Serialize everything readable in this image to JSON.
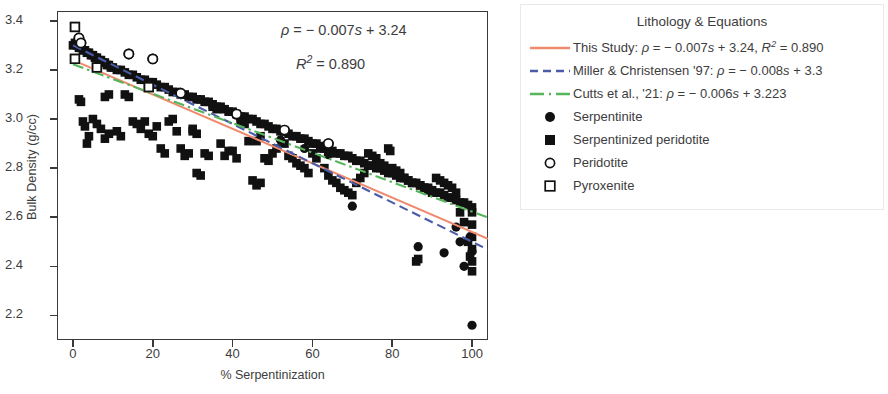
{
  "chart_data": {
    "type": "scatter",
    "title": "",
    "xlabel": "% Serpentinization",
    "ylabel": "Bulk Density (g/cc)",
    "xlim": [
      -4,
      104
    ],
    "ylim": [
      2.1,
      3.44
    ],
    "xticks": [
      "0",
      "20",
      "40",
      "60",
      "80",
      "100"
    ],
    "xtick_values": [
      0,
      20,
      40,
      60,
      80,
      100
    ],
    "yticks": [
      "3.4",
      "3.2",
      "3.0",
      "2.8",
      "2.6",
      "2.4",
      "2.2"
    ],
    "ytick_values": [
      3.4,
      3.2,
      3.0,
      2.8,
      2.6,
      2.4,
      2.2
    ],
    "grid": false,
    "legend_position": "right-outside",
    "annotations": [
      {
        "id": "equation",
        "text": "ρ = − 0.007s + 3.24",
        "x": 68,
        "y": 3.33
      },
      {
        "id": "r_squared",
        "text": "R² = 0.890",
        "x": 70,
        "y": 3.24
      }
    ],
    "fits": [
      {
        "name": "This Study",
        "slope": -0.007,
        "intercept": 3.24,
        "r2": 0.89,
        "color": "#ef8a6e",
        "style": "solid"
      },
      {
        "name": "Miller & Christensen '97",
        "slope": -0.008,
        "intercept": 3.3,
        "color": "#4a5ba8",
        "style": "dashed"
      },
      {
        "name": "Cutts et al., '21",
        "slope": -0.006,
        "intercept": 3.223,
        "color": "#56b45b",
        "style": "dashdot"
      }
    ],
    "series": [
      {
        "name": "Serpentinite",
        "marker": "filled-circle",
        "color": "#111111",
        "points": [
          [
            100,
            2.16
          ],
          [
            70,
            2.645
          ],
          [
            86.5,
            2.48
          ],
          [
            93,
            2.455
          ],
          [
            98,
            2.4
          ],
          [
            99.5,
            2.52
          ],
          [
            96,
            2.56
          ],
          [
            52,
            2.915
          ],
          [
            64,
            2.855
          ],
          [
            58,
            2.88
          ],
          [
            100,
            2.46
          ],
          [
            97,
            2.5
          ]
        ]
      },
      {
        "name": "Serpentinized peridotite",
        "marker": "filled-square",
        "color": "#111111",
        "points": [
          [
            0,
            3.3
          ],
          [
            0.5,
            3.31
          ],
          [
            1,
            3.3
          ],
          [
            1.5,
            3.29
          ],
          [
            2,
            3.29
          ],
          [
            2.5,
            3.28
          ],
          [
            3,
            3.28
          ],
          [
            3.5,
            3.27
          ],
          [
            4,
            3.27
          ],
          [
            4.5,
            3.26
          ],
          [
            5,
            3.26
          ],
          [
            5.5,
            3.25
          ],
          [
            6,
            3.25
          ],
          [
            6.5,
            3.24
          ],
          [
            7,
            3.24
          ],
          [
            7.5,
            3.23
          ],
          [
            8,
            3.23
          ],
          [
            8.5,
            3.22
          ],
          [
            9,
            3.22
          ],
          [
            9.5,
            3.21
          ],
          [
            10,
            3.21
          ],
          [
            11,
            3.2
          ],
          [
            12,
            3.2
          ],
          [
            13,
            3.19
          ],
          [
            14,
            3.18
          ],
          [
            15,
            3.18
          ],
          [
            16,
            3.17
          ],
          [
            17,
            3.16
          ],
          [
            18,
            3.16
          ],
          [
            19,
            3.15
          ],
          [
            20,
            3.15
          ],
          [
            21,
            3.14
          ],
          [
            22,
            3.13
          ],
          [
            23,
            3.13
          ],
          [
            24,
            3.12
          ],
          [
            25,
            3.11
          ],
          [
            26,
            3.11
          ],
          [
            27,
            3.1
          ],
          [
            28,
            3.1
          ],
          [
            29,
            3.09
          ],
          [
            30,
            3.09
          ],
          [
            31,
            3.08
          ],
          [
            32,
            3.08
          ],
          [
            33,
            3.07
          ],
          [
            34,
            3.07
          ],
          [
            35,
            3.06
          ],
          [
            36,
            3.05
          ],
          [
            37,
            3.05
          ],
          [
            38,
            3.04
          ],
          [
            39,
            3.03
          ],
          [
            40,
            3.03
          ],
          [
            41,
            3.02
          ],
          [
            42,
            3.01
          ],
          [
            43,
            3.01
          ],
          [
            44,
            3.0
          ],
          [
            45,
            3.0
          ],
          [
            46,
            2.99
          ],
          [
            47,
            2.98
          ],
          [
            48,
            2.98
          ],
          [
            49,
            2.97
          ],
          [
            50,
            2.96
          ],
          [
            51,
            2.96
          ],
          [
            52,
            2.95
          ],
          [
            53,
            2.95
          ],
          [
            54,
            2.94
          ],
          [
            55,
            2.93
          ],
          [
            56,
            2.93
          ],
          [
            57,
            2.92
          ],
          [
            58,
            2.92
          ],
          [
            59,
            2.91
          ],
          [
            60,
            2.9
          ],
          [
            61,
            2.9
          ],
          [
            62,
            2.89
          ],
          [
            63,
            2.88
          ],
          [
            64,
            2.88
          ],
          [
            65,
            2.87
          ],
          [
            66,
            2.86
          ],
          [
            67,
            2.86
          ],
          [
            68,
            2.85
          ],
          [
            69,
            2.85
          ],
          [
            70,
            2.84
          ],
          [
            71,
            2.83
          ],
          [
            72,
            2.83
          ],
          [
            73,
            2.82
          ],
          [
            74,
            2.81
          ],
          [
            75,
            2.81
          ],
          [
            76,
            2.8
          ],
          [
            77,
            2.8
          ],
          [
            78,
            2.79
          ],
          [
            79,
            2.78
          ],
          [
            80,
            2.78
          ],
          [
            81,
            2.77
          ],
          [
            82,
            2.76
          ],
          [
            83,
            2.76
          ],
          [
            84,
            2.75
          ],
          [
            85,
            2.74
          ],
          [
            86,
            2.74
          ],
          [
            87,
            2.73
          ],
          [
            88,
            2.72
          ],
          [
            89,
            2.72
          ],
          [
            90,
            2.71
          ],
          [
            91,
            2.7
          ],
          [
            92,
            2.7
          ],
          [
            93,
            2.69
          ],
          [
            94,
            2.68
          ],
          [
            95,
            2.68
          ],
          [
            96,
            2.67
          ],
          [
            97,
            2.66
          ],
          [
            98,
            2.66
          ],
          [
            99,
            2.65
          ],
          [
            100,
            2.64
          ],
          [
            1.5,
            3.08
          ],
          [
            2,
            3.07
          ],
          [
            2.5,
            2.99
          ],
          [
            3,
            2.97
          ],
          [
            3.5,
            2.9
          ],
          [
            8,
            3.09
          ],
          [
            9,
            3.1
          ],
          [
            7,
            2.96
          ],
          [
            8,
            2.92
          ],
          [
            9,
            2.94
          ],
          [
            13,
            3.1
          ],
          [
            14,
            3.09
          ],
          [
            15,
            2.99
          ],
          [
            16,
            2.98
          ],
          [
            17,
            2.96
          ],
          [
            18,
            2.99
          ],
          [
            19,
            2.94
          ],
          [
            20,
            2.93
          ],
          [
            22,
            2.88
          ],
          [
            23,
            2.86
          ],
          [
            24,
            2.99
          ],
          [
            25,
            3.0
          ],
          [
            26,
            2.95
          ],
          [
            27,
            2.88
          ],
          [
            28,
            2.85
          ],
          [
            29,
            2.86
          ],
          [
            30,
            2.96
          ],
          [
            31,
            2.78
          ],
          [
            32,
            2.77
          ],
          [
            33,
            2.86
          ],
          [
            34,
            2.85
          ],
          [
            35,
            3.05
          ],
          [
            36,
            3.04
          ],
          [
            37,
            2.9
          ],
          [
            38,
            2.85
          ],
          [
            39,
            2.87
          ],
          [
            40,
            2.87
          ],
          [
            41,
            2.84
          ],
          [
            44,
            2.91
          ],
          [
            45,
            2.75
          ],
          [
            46,
            2.73
          ],
          [
            47,
            2.74
          ],
          [
            48,
            2.84
          ],
          [
            49,
            2.83
          ],
          [
            50,
            2.86
          ],
          [
            51,
            2.88
          ],
          [
            53,
            2.9
          ],
          [
            54,
            2.85
          ],
          [
            55,
            2.84
          ],
          [
            56,
            2.82
          ],
          [
            57,
            2.81
          ],
          [
            58,
            2.8
          ],
          [
            59,
            2.78
          ],
          [
            60,
            2.86
          ],
          [
            61,
            2.84
          ],
          [
            62,
            2.88
          ],
          [
            63,
            2.8
          ],
          [
            64,
            2.77
          ],
          [
            65,
            2.75
          ],
          [
            66,
            2.74
          ],
          [
            67,
            2.72
          ],
          [
            68,
            2.71
          ],
          [
            69,
            2.7
          ],
          [
            70,
            2.69
          ],
          [
            71,
            2.74
          ],
          [
            72,
            2.76
          ],
          [
            73,
            2.78
          ],
          [
            74,
            2.86
          ],
          [
            75,
            2.85
          ],
          [
            76,
            2.84
          ],
          [
            77,
            2.82
          ],
          [
            78,
            2.81
          ],
          [
            79,
            2.88
          ],
          [
            79.5,
            2.87
          ],
          [
            80,
            2.8
          ],
          [
            81,
            2.79
          ],
          [
            82,
            2.78
          ],
          [
            83,
            2.76
          ],
          [
            84,
            2.75
          ],
          [
            85,
            2.74
          ],
          [
            86,
            2.42
          ],
          [
            86.5,
            2.43
          ],
          [
            87,
            2.73
          ],
          [
            88,
            2.72
          ],
          [
            89,
            2.71
          ],
          [
            90,
            2.7
          ],
          [
            91,
            2.76
          ],
          [
            92,
            2.75
          ],
          [
            93,
            2.74
          ],
          [
            94,
            2.73
          ],
          [
            95,
            2.72
          ],
          [
            96,
            2.7
          ],
          [
            97,
            2.62
          ],
          [
            98,
            2.58
          ],
          [
            99,
            2.5
          ],
          [
            99.5,
            2.44
          ],
          [
            100,
            2.38
          ],
          [
            100,
            2.42
          ],
          [
            100,
            2.47
          ],
          [
            100,
            2.52
          ],
          [
            100,
            2.57
          ],
          [
            100,
            2.62
          ],
          [
            42,
            2.99
          ],
          [
            43,
            2.98
          ],
          [
            30,
            2.95
          ],
          [
            31,
            2.94
          ],
          [
            12,
            2.93
          ],
          [
            11,
            2.95
          ],
          [
            5,
            3.0
          ],
          [
            6,
            2.98
          ],
          [
            4,
            2.93
          ],
          [
            21,
            2.97
          ],
          [
            46,
            2.91
          ],
          [
            47,
            2.93
          ]
        ]
      },
      {
        "name": "Peridotite",
        "marker": "open-circle",
        "color": "#111111",
        "points": [
          [
            1.5,
            3.33
          ],
          [
            14,
            3.265
          ],
          [
            20,
            3.245
          ],
          [
            2,
            3.31
          ],
          [
            27,
            3.105
          ],
          [
            41,
            3.02
          ],
          [
            53,
            2.955
          ],
          [
            64,
            2.9
          ]
        ]
      },
      {
        "name": "Pyroxenite",
        "marker": "open-square",
        "color": "#111111",
        "points": [
          [
            0.5,
            3.375
          ],
          [
            0.5,
            3.245
          ],
          [
            6,
            3.21
          ],
          [
            19,
            3.13
          ]
        ]
      }
    ]
  },
  "plot": {
    "y_axis_label": "Bulk Density (g/cc)",
    "x_axis_label": "% Serpentinization",
    "annotation_equation_lhs": "ρ",
    "annotation_equation_rhs": " = − 0.007",
    "annotation_equation_var": "s",
    "annotation_equation_tail": " + 3.24",
    "annotation_r2_lhs": "R",
    "annotation_r2_sup": "2",
    "annotation_r2_rhs": " = 0.890"
  },
  "legend": {
    "title": "Lithology & Equations",
    "rows": [
      {
        "key": "line-solid",
        "key_name": "this-study-line-swatch",
        "color": "#ef8a6e",
        "label": "This Study: ρ = − 0.007s + 3.24, R² = 0.890"
      },
      {
        "key": "line-dashed",
        "key_name": "miller-christensen-line-swatch",
        "color": "#4a5ba8",
        "label": "Miller & Christensen '97: ρ = − 0.008s + 3.3"
      },
      {
        "key": "line-dashdot",
        "key_name": "cutts-line-swatch",
        "color": "#56b45b",
        "label": "Cutts et al., '21: ρ = − 0.006s + 3.223"
      },
      {
        "key": "filled-circle",
        "key_name": "serpentinite-marker-swatch",
        "color": "#111111",
        "label": "Serpentinite"
      },
      {
        "key": "filled-square",
        "key_name": "serpentinized-peridotite-marker-swatch",
        "color": "#111111",
        "label": "Serpentinized peridotite"
      },
      {
        "key": "open-circle",
        "key_name": "peridotite-marker-swatch",
        "color": "#111111",
        "label": "Peridotite"
      },
      {
        "key": "open-square",
        "key_name": "pyroxenite-marker-swatch",
        "color": "#111111",
        "label": "Pyroxenite"
      }
    ]
  }
}
